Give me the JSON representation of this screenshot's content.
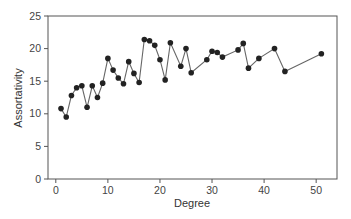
{
  "chart_data": {
    "type": "line",
    "title": "",
    "xlabel": "Degree",
    "ylabel": "Assortativity",
    "xlim": [
      -1.5,
      54
    ],
    "ylim": [
      0,
      25
    ],
    "xticks": [
      0,
      10,
      20,
      30,
      40,
      50
    ],
    "yticks": [
      0,
      5,
      10,
      15,
      20,
      25
    ],
    "grid": false,
    "legend": null,
    "series": [
      {
        "name": "Assortativity",
        "marker": "circle",
        "color": "#222222",
        "line_color": "#666666",
        "x": [
          1,
          2,
          3,
          4,
          5,
          6,
          7,
          8,
          9,
          10,
          11,
          12,
          13,
          14,
          15,
          16,
          17,
          18,
          19,
          20,
          21,
          22,
          24,
          25,
          26,
          29,
          30,
          31,
          32,
          35,
          36,
          37,
          39,
          42,
          44,
          51
        ],
        "y": [
          10.8,
          9.5,
          12.8,
          14.0,
          14.3,
          11.0,
          14.3,
          12.5,
          14.7,
          18.5,
          16.7,
          15.5,
          14.6,
          18.0,
          16.2,
          14.8,
          21.4,
          21.2,
          20.5,
          18.3,
          15.2,
          20.9,
          17.3,
          20.0,
          16.3,
          18.3,
          19.6,
          19.4,
          18.7,
          19.8,
          20.8,
          17.0,
          18.5,
          20.0,
          16.5,
          19.2
        ]
      }
    ]
  }
}
